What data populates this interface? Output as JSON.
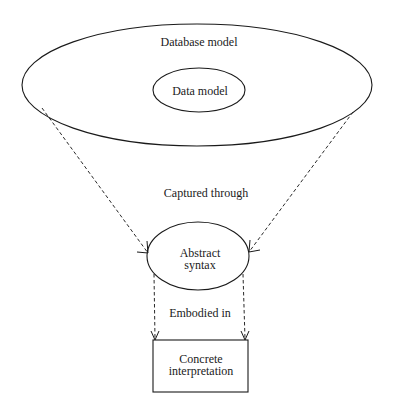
{
  "diagram": {
    "nodes": {
      "database_model": {
        "label": "Database model",
        "shape": "ellipse"
      },
      "data_model": {
        "label": "Data model",
        "shape": "ellipse",
        "nested_in": "database_model"
      },
      "abstract_syntax": {
        "label_line1": "Abstract",
        "label_line2": "syntax",
        "shape": "ellipse"
      },
      "concrete_interpretation": {
        "label_line1": "Concrete",
        "label_line2": "interpretation",
        "shape": "rectangle"
      }
    },
    "edges": {
      "captured_through": {
        "label": "Captured through",
        "from": "database_model",
        "to": "abstract_syntax",
        "style": "dashed",
        "count": 2
      },
      "embodied_in": {
        "label": "Embodied in",
        "from": "abstract_syntax",
        "to": "concrete_interpretation",
        "style": "dashed",
        "count": 2
      }
    },
    "colors": {
      "line": "#1a1a1a",
      "background": "#ffffff"
    }
  }
}
